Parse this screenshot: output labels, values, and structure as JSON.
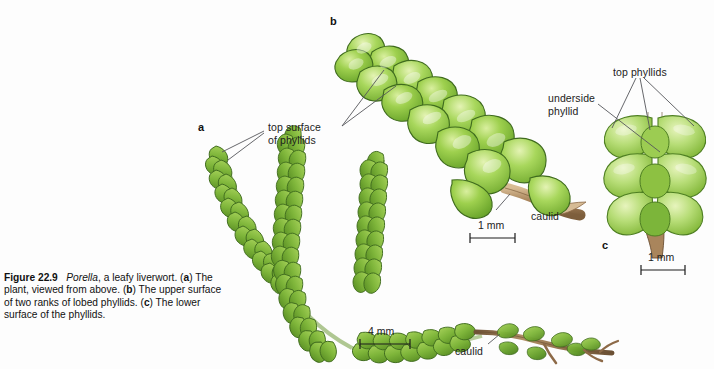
{
  "figure": {
    "number": "Figure 22.9",
    "genus": "Porella",
    "caption_rest_1": ", a leafy liverwort. (",
    "panel_a": "a",
    "caption_rest_2": ") The plant, viewed from above. (",
    "panel_b": "b",
    "caption_rest_3": ") The upper surface of two ranks of lobed phyllids. (",
    "panel_c": "c",
    "caption_rest_4": ") The lower surface of the phyllids.",
    "caption_full": "Figure 22.9   Porella, a leafy liverwort. (a) The plant, viewed from above. (b) The upper surface of two ranks of lobed phyllids. (c) The lower surface of the phyllids."
  },
  "panel_letters": {
    "a": "a",
    "b": "b",
    "c": "c"
  },
  "labels": {
    "top_surface_line1": "top surface",
    "top_surface_line2": "of phyllids",
    "top_phyllids": "top phyllids",
    "underside_line1": "underside",
    "underside_line2": "phyllid",
    "caulid_b": "caulid",
    "caulid_a": "caulid"
  },
  "scale_bars": {
    "panel_b": "1 mm",
    "panel_a": "4 mm",
    "panel_c": "1 mm"
  },
  "colors": {
    "background": "#fdfdfd",
    "leaf_dark_green": "#5f9b2e",
    "leaf_mid_green": "#7cb342",
    "leaf_light_green": "#a5cf5a",
    "leaf_pale_green": "#c8e08a",
    "leaf_bright_green": "#8dc63f",
    "leaf_outline": "#3f6b1e",
    "stem_brown": "#8d6a48",
    "stem_light_brown": "#c8a97e",
    "stem_outline": "#6b4f33",
    "text": "#1c1c1c",
    "leader_line": "#55565a"
  }
}
